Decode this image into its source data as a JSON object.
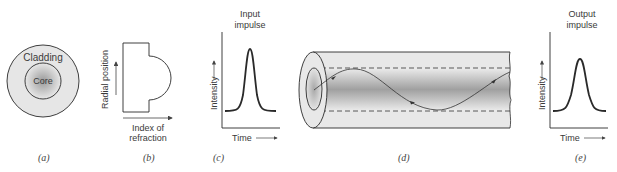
{
  "panels": {
    "a": {
      "caption": "(a)",
      "outer_label": "Cladding",
      "inner_label": "Core"
    },
    "b": {
      "caption": "(b)",
      "y_axis_label": "Radial position",
      "x_axis_label_line1": "Index of",
      "x_axis_label_line2": "refraction"
    },
    "c": {
      "caption": "(c)",
      "title_line1": "Input",
      "title_line2": "impulse",
      "y_axis_label": "Intensity",
      "x_axis_label": "Time"
    },
    "d": {
      "caption": "(d)"
    },
    "e": {
      "caption": "(e)",
      "title_line1": "Output",
      "title_line2": "impulse",
      "y_axis_label": "Intensity",
      "x_axis_label": "Time"
    }
  },
  "colors": {
    "stroke": "#2a2a2a",
    "cladding_fill": "#e6e6e6",
    "core_dark": "#9a9a9a"
  }
}
